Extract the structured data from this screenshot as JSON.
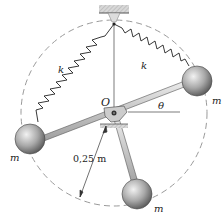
{
  "diagram": {
    "labels": {
      "pivot": "O",
      "angle": "θ",
      "spring_left": "k",
      "spring_right": "k",
      "mass_right": "m",
      "mass_left": "m",
      "mass_bottom": "m",
      "radius": "0,25 m"
    },
    "colors": {
      "line": "#333333",
      "dashed_circle": "#9a9a9a",
      "sphere_light": "#e6e6e6",
      "sphere_dark": "#6b6b6b",
      "support": "#bdbdbd"
    }
  }
}
